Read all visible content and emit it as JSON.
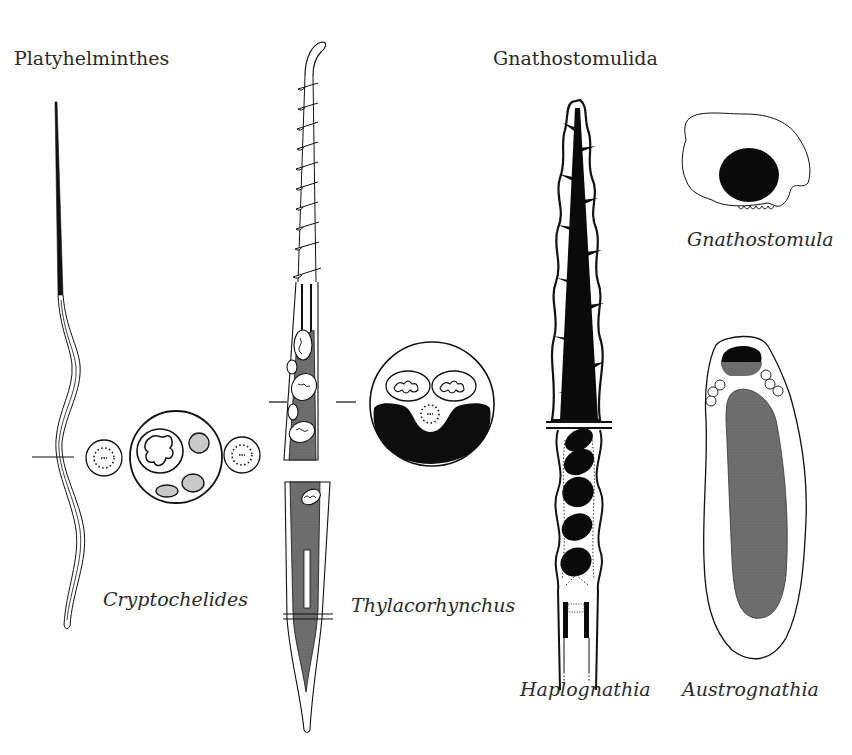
{
  "figure": {
    "groups": [
      {
        "title": "Platyhelminthes",
        "species": [
          {
            "name": "Cryptochelides",
            "structure": "filiform sperm with cross-section showing nucleus, mitochondria and axonemes"
          },
          {
            "name": "Thylacorhynchus",
            "structure": "sperm with spiral mitochondria and cross-section"
          }
        ]
      },
      {
        "title": "Gnathostomulida",
        "species": [
          {
            "name": "Haplognathia",
            "structure": "conical sperm with dark nucleus and spiraled mitochondria"
          },
          {
            "name": "Gnathostomula",
            "structure": "round sperm cell with dark nucleus"
          },
          {
            "name": "Austrognathia",
            "structure": "elongate oval sperm with large grey body"
          }
        ]
      }
    ],
    "colors": {
      "ink": "#111111",
      "grey_fill": "#6e6e6e",
      "light_grey": "#c9c9c9",
      "background": "#ffffff"
    }
  }
}
